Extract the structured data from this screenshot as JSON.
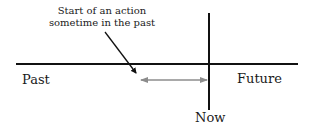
{
  "diagram": {
    "annotation": {
      "line1": "Start of an action",
      "line2": "sometime in the past"
    },
    "labels": {
      "past": "Past",
      "future": "Future",
      "now": "Now"
    },
    "colors": {
      "timeline": "#111111",
      "duration_arrow": "#8c8c8c",
      "text": "#1a1a1a"
    }
  }
}
